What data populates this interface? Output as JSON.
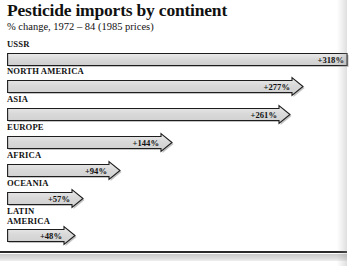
{
  "chart_data": {
    "type": "bar",
    "title": "Pesticide imports by continent",
    "subtitle": "% change, 1972 – 84 (1985 prices)",
    "xlabel": "",
    "ylabel": "",
    "orientation": "horizontal",
    "grid": false,
    "legend": false,
    "unit": "%",
    "xlim": [
      0,
      318
    ],
    "categories": [
      "USSR",
      "NORTH AMERICA",
      "ASIA",
      "EUROPE",
      "AFRICA",
      "OCEANIA",
      "LATIN AMERICA"
    ],
    "values": [
      318,
      277,
      261,
      144,
      94,
      57,
      48
    ],
    "data_labels": [
      "+318%",
      "+277%",
      "+261%",
      "+144%",
      "+94%",
      "+57%",
      "+48%"
    ]
  },
  "rows": [
    {
      "label": "USSR",
      "value_label": "+318%",
      "value": 318,
      "label_top": 0,
      "bar_top": 10,
      "bar_width": 340,
      "clipped": true
    },
    {
      "label": "NORTH AMERICA",
      "value_label": "+277%",
      "value": 277,
      "label_top": 27,
      "bar_top": 37,
      "bar_width": 296,
      "clipped": false
    },
    {
      "label": "ASIA",
      "value_label": "+261%",
      "value": 261,
      "label_top": 55,
      "bar_top": 65,
      "bar_width": 283,
      "clipped": false
    },
    {
      "label": "EUROPE",
      "value_label": "+144%",
      "value": 144,
      "label_top": 83,
      "bar_top": 93,
      "bar_width": 165,
      "clipped": false
    },
    {
      "label": "AFRICA",
      "value_label": "+94%",
      "value": 94,
      "label_top": 111,
      "bar_top": 121,
      "bar_width": 113,
      "clipped": false
    },
    {
      "label": "OCEANIA",
      "value_label": "+57%",
      "value": 57,
      "label_top": 139,
      "bar_top": 149,
      "bar_width": 76,
      "clipped": false
    },
    {
      "label": "LATIN\nAMERICA",
      "value_label": "+48%",
      "value": 48,
      "label_top": 167,
      "bar_top": 186,
      "bar_width": 68,
      "clipped": false
    }
  ],
  "style": {
    "bar_fill": "#d9d9d9",
    "bar_fill_light": "#ebebeb",
    "bar_stroke": "#1d1d1d",
    "text_color": "#111111",
    "footer_rule_color": "#2a2a2a"
  }
}
